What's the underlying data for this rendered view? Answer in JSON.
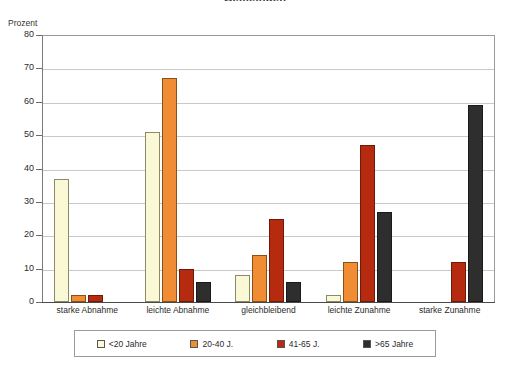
{
  "chart_data": {
    "type": "bar",
    "title": "Gemeinden",
    "ylabel": "Prozent",
    "xlabel": "",
    "ylim": [
      0,
      80
    ],
    "yticks": [
      0,
      10,
      20,
      30,
      40,
      50,
      60,
      70,
      80
    ],
    "grid": true,
    "legend_position": "bottom",
    "categories": [
      "starke Abnahme",
      "leichte Abnahme",
      "gleichbleibend",
      "leichte Zunahme",
      "starke Zunahme"
    ],
    "series": [
      {
        "name": "<20 Jahre",
        "color": "#FAF8D5",
        "values": [
          37,
          51,
          8,
          2,
          0
        ]
      },
      {
        "name": "20-40 J.",
        "color": "#F08C33",
        "values": [
          2,
          67,
          14,
          12,
          0
        ]
      },
      {
        "name": "41-65 J.",
        "color": "#B62A10",
        "values": [
          2,
          10,
          25,
          47,
          12
        ]
      },
      {
        "name": ">65 Jahre",
        "color": "#2E2E2E",
        "values": [
          0,
          6,
          6,
          27,
          59
        ]
      }
    ]
  }
}
